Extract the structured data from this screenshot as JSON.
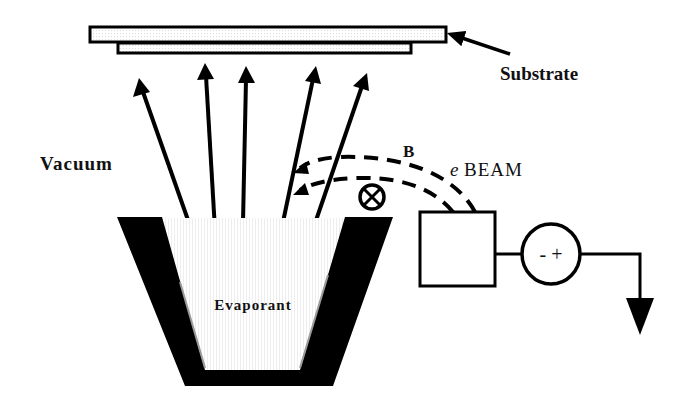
{
  "diagram": {
    "labels": {
      "substrate": "Substrate",
      "vacuum": "Vacuum",
      "magnetic_field": "B",
      "ebeam_prefix": "e",
      "ebeam": "BEAM",
      "evaporant": "Evaporant",
      "power_supply_polarity": "- +"
    },
    "components": [
      {
        "id": "substrate",
        "shape": "stacked-rectangles"
      },
      {
        "id": "crucible",
        "shape": "trapezoid-hearth"
      },
      {
        "id": "evaporant",
        "shape": "filled-trapezoid"
      },
      {
        "id": "electron-gun",
        "shape": "box"
      },
      {
        "id": "power-supply",
        "shape": "circle"
      },
      {
        "id": "ground",
        "shape": "down-arrow"
      },
      {
        "id": "field-into-page",
        "shape": "circle-x"
      }
    ],
    "vapor_arrows": 5,
    "colors": {
      "stroke": "#000000",
      "background": "#ffffff",
      "fill_light": "#f4f4f4"
    }
  }
}
